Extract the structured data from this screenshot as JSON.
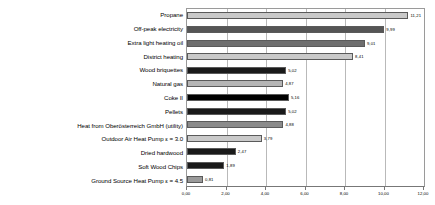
{
  "chart_data": {
    "type": "bar",
    "orientation": "horizontal",
    "title": "",
    "xlabel": "",
    "ylabel": "",
    "xlim": [
      0.0,
      12.0
    ],
    "xticks": [
      "0,00",
      "2,00",
      "4,00",
      "6,00",
      "8,00",
      "10,00",
      "12,00"
    ],
    "xtick_values": [
      0,
      2,
      4,
      6,
      8,
      10,
      12
    ],
    "grid": true,
    "legend": "none",
    "categories": [
      "Propane",
      "Off-peak electricity",
      "Extra light heating oil",
      "District heating",
      "Wood briquettes",
      "Natural gas",
      "Coke II",
      "Pellets",
      "Heat from Oberösterreich GmbH (utility)",
      "Outdoor Air Heat Pump ε = 3.0",
      "Dried hardwood",
      "Soft Wood Chips",
      "Ground Source Heat Pump ε = 4.5"
    ],
    "values": [
      11.21,
      9.99,
      9.01,
      8.41,
      5.02,
      4.87,
      5.16,
      5.02,
      4.88,
      3.79,
      2.47,
      1.89,
      0.81
    ],
    "value_labels": [
      "11,21",
      "9,99",
      "9,01",
      "8,41",
      "5,02",
      "4,87",
      "5,16",
      "5,02",
      "4,88",
      "3,79",
      "2,47",
      "1,89",
      "0,81"
    ],
    "bar_colors": [
      "#c9c9c9",
      "#555555",
      "#6e6e6e",
      "#c9c9c9",
      "#1a1a1a",
      "#b5b5b5",
      "#000000",
      "#1a1a1a",
      "#8a8a8a",
      "#c9c9c9",
      "#1a1a1a",
      "#1a1a1a",
      "#9a9a9a"
    ]
  }
}
